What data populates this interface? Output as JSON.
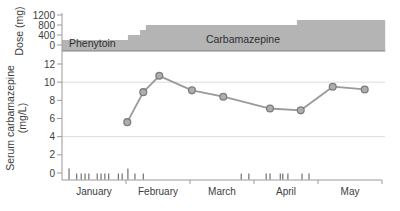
{
  "chart_data": [
    {
      "type": "area",
      "panel": "dose",
      "ylabel": "Dose (mg)",
      "yticks": [
        0,
        400,
        800,
        1200
      ],
      "ylim": [
        0,
        1200
      ],
      "region_labels": {
        "left": "Phenytoin",
        "main": "Carbamazepine"
      },
      "dose_steps": [
        {
          "from_month": 0.0,
          "to_month": 1.03,
          "dose_mg": 200
        },
        {
          "from_month": 1.03,
          "to_month": 1.22,
          "dose_mg": 400
        },
        {
          "from_month": 1.22,
          "to_month": 1.31,
          "dose_mg": 600
        },
        {
          "from_month": 1.31,
          "to_month": 3.67,
          "dose_mg": 800
        },
        {
          "from_month": 3.67,
          "to_month": 5.05,
          "dose_mg": 1000
        }
      ]
    },
    {
      "type": "line",
      "panel": "serum",
      "ylabel_line1": "Serum carbamazepine",
      "ylabel_line2": "(mg/L)",
      "yticks": [
        0,
        2,
        4,
        6,
        8,
        10,
        12
      ],
      "ylim": [
        0,
        12
      ],
      "gridlines_at": [
        4,
        10
      ],
      "x_categories": [
        "January",
        "February",
        "March",
        "April",
        "May"
      ],
      "points": [
        {
          "month": 1.02,
          "value": 5.6
        },
        {
          "month": 1.27,
          "value": 8.9
        },
        {
          "month": 1.52,
          "value": 10.7
        },
        {
          "month": 2.03,
          "value": 9.1
        },
        {
          "month": 2.52,
          "value": 8.4
        },
        {
          "month": 3.25,
          "value": 7.1
        },
        {
          "month": 3.73,
          "value": 6.9
        },
        {
          "month": 4.23,
          "value": 9.5
        },
        {
          "month": 4.73,
          "value": 9.2
        }
      ],
      "event_marks_months": [
        0.11,
        0.23,
        0.3,
        0.36,
        0.42,
        0.55,
        0.61,
        0.67,
        0.73,
        0.88,
        0.94,
        1.03,
        1.14,
        1.27,
        2.8,
        2.92,
        3.19,
        3.25,
        3.41,
        3.45,
        3.53,
        3.75,
        3.86
      ],
      "tall_event_marks_months": [
        0.11,
        1.03
      ]
    }
  ],
  "colors": {
    "area": "#b4b4b4",
    "area_edge": "#828282",
    "axis": "#9a9a9a",
    "grid": "#dcdcdc",
    "text": "#3d3d3d",
    "drug_label_text": "#2e2e2e",
    "line": "#9a9a9a",
    "marker_fill": "#aeaeae",
    "marker_stroke": "#7d7d7d",
    "event_mark": "#545454"
  }
}
